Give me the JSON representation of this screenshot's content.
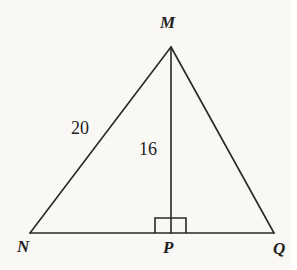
{
  "figure": {
    "kind": "triangle-with-altitude",
    "background_color": "#f9f8f5",
    "stroke_color": "#2a2826",
    "stroke_width": 1.6,
    "vertices": [
      {
        "id": "M",
        "label": "M",
        "x": 171,
        "y": 47,
        "role": "apex"
      },
      {
        "id": "N",
        "label": "N",
        "x": 30,
        "y": 233,
        "role": "base-left"
      },
      {
        "id": "P",
        "label": "P",
        "x": 171,
        "y": 233,
        "role": "altitude-foot"
      },
      {
        "id": "Q",
        "label": "Q",
        "x": 274,
        "y": 233,
        "role": "base-right"
      }
    ],
    "segments": [
      {
        "id": "MN",
        "from": "M",
        "to": "N",
        "kind": "triangle-side"
      },
      {
        "id": "MQ",
        "from": "M",
        "to": "Q",
        "kind": "triangle-side"
      },
      {
        "id": "NQ",
        "from": "N",
        "to": "Q",
        "kind": "triangle-base"
      },
      {
        "id": "MP",
        "from": "M",
        "to": "P",
        "kind": "altitude"
      }
    ],
    "measures": [
      {
        "id": "side-MN",
        "segment": "MN",
        "value": "20",
        "x": 83,
        "y": 128
      },
      {
        "id": "altitude-MP",
        "segment": "MP",
        "value": "16",
        "x": 151,
        "y": 149
      }
    ],
    "right_angle": {
      "at": "P",
      "between": [
        "MP",
        "NQ"
      ],
      "marker": "square",
      "x": 155,
      "y": 218,
      "width": 31,
      "height": 15
    }
  }
}
